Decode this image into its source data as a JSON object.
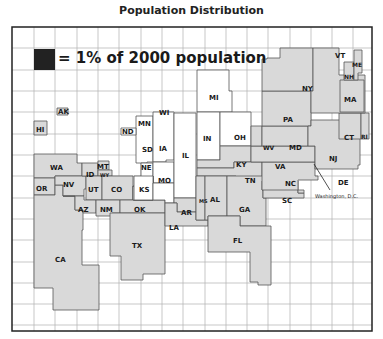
{
  "title": "Population Distribution",
  "legend": {
    "swatch_color": "#222222",
    "text": "= 1% of 2000 population"
  },
  "colors": {
    "gray_state": "#d9d9d9",
    "white_state": "#ffffff",
    "border": "#555555",
    "grid": "#b0b0b0",
    "frame": "#222222"
  },
  "annotation": "Washington, D.C.",
  "states": {
    "AK": "AK",
    "HI": "HI",
    "ND": "ND",
    "WA": "WA",
    "OR": "OR",
    "CA": "CA",
    "ID": "ID",
    "MT": "MT",
    "WY": "WY",
    "NV": "NV",
    "UT": "UT",
    "CO": "CO",
    "AZ": "AZ",
    "NM": "NM",
    "TX": "TX",
    "OK": "OK",
    "KS": "KS",
    "NE": "NE",
    "SD": "SD",
    "MN": "MN",
    "WI": "WI",
    "IA": "IA",
    "MO": "MO",
    "IL": "IL",
    "MI": "MI",
    "IN": "IN",
    "OH": "OH",
    "KY": "KY",
    "TN": "TN",
    "AR": "AR",
    "LA": "LA",
    "MS": "MS",
    "AL": "AL",
    "GA": "GA",
    "FL": "FL",
    "SC": "SC",
    "NC": "NC",
    "VA": "VA",
    "WV": "WV",
    "MD": "MD",
    "DE": "DE",
    "NJ": "NJ",
    "PA": "PA",
    "NY": "NY",
    "CT": "CT",
    "RI": "RI",
    "MA": "MA",
    "VT": "VT",
    "NH": "NH",
    "ME": "ME"
  }
}
